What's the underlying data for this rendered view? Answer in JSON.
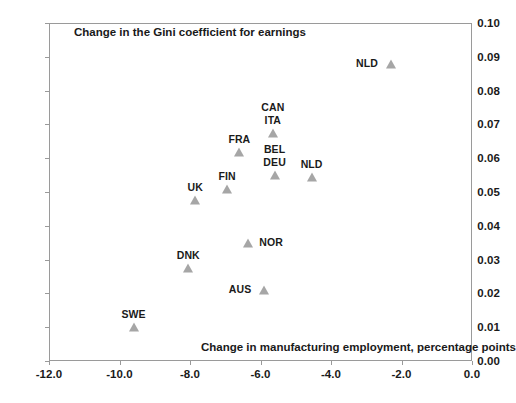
{
  "chart_data": {
    "type": "scatter",
    "title": "Change in the Gini coefficient for earnings",
    "xlabel": "Change in manufacturing employment, percentage points",
    "ylabel": "",
    "xlim": [
      -12.0,
      0.0
    ],
    "ylim": [
      0.0,
      0.1
    ],
    "grid": false,
    "legend": "none",
    "x_ticks": [
      "-12.0",
      "-10.0",
      "-8.0",
      "-6.0",
      "-4.0",
      "-2.0",
      "0.0"
    ],
    "x_tick_values": [
      -12.0,
      -10.0,
      -8.0,
      -6.0,
      -4.0,
      -2.0,
      0.0
    ],
    "y_ticks": [
      "0.00",
      "0.01",
      "0.02",
      "0.03",
      "0.04",
      "0.05",
      "0.06",
      "0.07",
      "0.08",
      "0.09",
      "0.10"
    ],
    "y_tick_values": [
      0.0,
      0.01,
      0.02,
      0.03,
      0.04,
      0.05,
      0.06,
      0.07,
      0.08,
      0.09,
      0.1
    ],
    "marker_color": "#a6a6a6",
    "marker_shape": "triangle",
    "points": [
      {
        "label": "NLD",
        "x": -2.3,
        "y": 0.088,
        "label_pos": "left"
      },
      {
        "label": "CAN",
        "x": -5.65,
        "y": 0.0675,
        "label_pos": "above2"
      },
      {
        "label": "ITA",
        "x": -5.65,
        "y": 0.0675,
        "label_pos": "above"
      },
      {
        "label": "FRA",
        "x": -6.6,
        "y": 0.0618,
        "label_pos": "above"
      },
      {
        "label": "BEL",
        "x": -5.6,
        "y": 0.055,
        "label_pos": "above2"
      },
      {
        "label": "DEU",
        "x": -5.6,
        "y": 0.055,
        "label_pos": "above"
      },
      {
        "label": "NLD",
        "x": -4.55,
        "y": 0.0543,
        "label_pos": "above"
      },
      {
        "label": "FIN",
        "x": -6.95,
        "y": 0.0508,
        "label_pos": "above"
      },
      {
        "label": "UK",
        "x": -7.85,
        "y": 0.0477,
        "label_pos": "above"
      },
      {
        "label": "NOR",
        "x": -6.35,
        "y": 0.035,
        "label_pos": "right"
      },
      {
        "label": "DNK",
        "x": -8.05,
        "y": 0.0275,
        "label_pos": "above"
      },
      {
        "label": "AUS",
        "x": -5.9,
        "y": 0.021,
        "label_pos": "left"
      },
      {
        "label": "SWE",
        "x": -9.6,
        "y": 0.01,
        "label_pos": "above"
      }
    ]
  }
}
